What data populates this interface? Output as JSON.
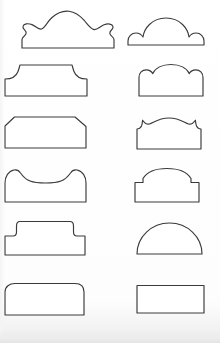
{
  "plate": {
    "title": "Gravestone Profile Shapes Plate",
    "description": "Twelve outline profile shapes arranged in a six-row by two-column grid",
    "width": 220,
    "height": 343,
    "background_color": "#fefefe",
    "outline_color": "#3a3a3a",
    "fill_color": "#ffffff",
    "stroke_width": 1.15,
    "columns": 2,
    "rows": 6,
    "total_shapes": 12
  },
  "shapes": [
    {
      "id": "shape-1",
      "row": 1,
      "column": 1,
      "name": "triple-scallop-crest",
      "label": "Triple scallop crest with lobed shoulders",
      "box": {
        "x": 18,
        "y": 6,
        "width": 88,
        "height": 44
      },
      "path": "M 4 42 L 4 33.5 C 4 30.5 8 30 8.2 27 C 8.4 24 4.4 23.5 5 20.5 C 5.6 17.6 10 17 14 18.6 C 18 20.2 20.5 23.8 23.5 23 C 27 22 29 16 34 11.5 C 39 7 45 4.5 51 5.2 C 57 5.9 62 9.6 66 14.2 C 70 18.8 72.5 23.2 76 23.6 C 79.5 24 82 20.4 86 18.8 C 90 17.2 94.4 17.8 95 20.7 C 95.6 23.7 91.6 24.2 91.8 27.2 C 92 30.2 96 30.7 96 33.7 L 96 42 Z"
    },
    {
      "id": "shape-2",
      "row": 1,
      "column": 2,
      "name": "cloud-dome-crest",
      "label": "Central dome with two rounded shoulder lobes",
      "box": {
        "x": 126,
        "y": 12,
        "width": 80,
        "height": 35
      },
      "path": "M 2 33 L 2 29 C 2 24.5 5.5 21 10 21 C 13 21 15.5 22.6 17 25 C 18 17 25.5 6 40 6 C 54.5 6 62 17 63 25 C 64.5 22.6 67 21 70 21 C 74.5 21 78 24.5 78 29 L 78 33 Z"
    },
    {
      "id": "shape-3",
      "row": 2,
      "column": 1,
      "name": "flared-shoulder-tablet",
      "label": "Flat top tablet with concave flared shoulders",
      "box": {
        "x": 4,
        "y": 62,
        "width": 86,
        "height": 36
      },
      "path": "M 1 34 L 1 17 C 8 17 12 15 14 9.5 C 15.2 6.2 15.6 4 16 3 L 68 3 C 68.4 4 68.8 6.2 70 9.5 C 72 15 76 17 83 17 L 83 34 Z"
    },
    {
      "id": "shape-4",
      "row": 2,
      "column": 2,
      "name": "triple-lobe-arch",
      "label": "Broad central arch flanked by two shoulder lobes",
      "box": {
        "x": 138,
        "y": 62,
        "width": 76,
        "height": 36
      },
      "path": "M 1 34 L 1 15.5 C 1 11 4.2 7.8 8.2 7.8 C 11.2 7.8 13.6 9.4 14.8 11.6 C 17.2 6.2 24 2.5 33 2.5 C 42 2.5 48.8 6.2 51.2 11.6 C 52.4 9.4 54.8 7.8 57.8 7.8 C 61.8 7.8 65 11 65 15.5 L 65 34 Z"
    },
    {
      "id": "shape-5",
      "row": 3,
      "column": 1,
      "name": "chamfered-corner-tablet",
      "label": "Flat top tablet with chamfered upper corners",
      "box": {
        "x": 4,
        "y": 115,
        "width": 86,
        "height": 36
      },
      "path": "M 1 33 L 1 11 L 10.5 2 L 71 2 L 82 11.5 L 82 33 Z"
    },
    {
      "id": "shape-6",
      "row": 3,
      "column": 2,
      "name": "ogee-arch-notched-shoulders",
      "label": "Low segmental arch with notched ogee shoulders",
      "box": {
        "x": 136,
        "y": 115,
        "width": 80,
        "height": 36
      },
      "path": "M 1 34 L 1 14 C 2.5 14 4.5 13 5.5 11 C 6.2 9.5 6.4 7 6.6 5.2 C 8.2 7.6 11 9.5 13.5 9 C 17 8.3 22 3 33 3 C 44 3 49 8.3 52.5 9 C 55 9.5 57.8 7.6 59.4 5.2 C 59.6 7 59.8 9.5 60.5 11 C 61.5 13 63.5 14 65 14 L 65 34 Z"
    },
    {
      "id": "shape-7",
      "row": 4,
      "column": 1,
      "name": "concave-dipped-top",
      "label": "Shouldered tablet with concave dipped top",
      "box": {
        "x": 4,
        "y": 167,
        "width": 86,
        "height": 38
      },
      "path": "M 1 35 L 1 16 C 1 9.5 4.5 4 10 3 C 13 2.5 15 3.6 16.5 6 C 22 14 28 16 41.5 16 C 55 16 61 14 66.5 6 C 68 3.6 70 2.5 73 3 C 78.5 4 82 9.5 82 16 L 82 35 Z"
    },
    {
      "id": "shape-8",
      "row": 4,
      "column": 2,
      "name": "stepped-round-arch",
      "label": "Round arch rising from small stepped shoulders",
      "box": {
        "x": 134,
        "y": 167,
        "width": 80,
        "height": 38
      },
      "path": "M 1 35 L 1 15.5 L 9 15.5 L 9 11.5 C 13 5 22 1.5 33 1.5 C 44 1.5 53 5 57 11.5 L 57 15.5 L 65 15.5 L 65 35 Z"
    },
    {
      "id": "shape-9",
      "row": 5,
      "column": 1,
      "name": "stepped-table-top",
      "label": "Stepped table top with raised central panel",
      "box": {
        "x": 4,
        "y": 218,
        "width": 86,
        "height": 40
      },
      "path": "M 1 37 L 1 18 L 9 18 C 11.5 18 12.5 16.5 12.5 14 L 12.5 8 C 12.5 5.5 13.5 3.5 16 3.5 L 66 3.5 C 68.5 3.5 69.5 5.5 69.5 8 L 69.5 14 C 69.5 16.5 70.5 18 73 18 L 81 18 L 81 37 Z"
    },
    {
      "id": "shape-10",
      "row": 5,
      "column": 2,
      "name": "semicircle-dome",
      "label": "Plain semicircular dome on flat base",
      "box": {
        "x": 136,
        "y": 222,
        "width": 78,
        "height": 34
      },
      "path": "M 1 32 A 32.5 31 0 0 1 66 32 Z"
    },
    {
      "id": "shape-11",
      "row": 6,
      "column": 1,
      "name": "round-top-corner-tablet",
      "label": "Rectangular tablet with rounded top corners",
      "box": {
        "x": 4,
        "y": 282,
        "width": 86,
        "height": 36
      },
      "path": "M 1 33 L 1 10 C 1 4.5 5.5 1.5 11 1.5 L 71 1.5 C 76.5 1.5 80 4.5 80 10 L 80 33 Z"
    },
    {
      "id": "shape-12",
      "row": 6,
      "column": 2,
      "name": "plain-rectangle-tablet",
      "label": "Plain rectangular tablet",
      "box": {
        "x": 136,
        "y": 284,
        "width": 78,
        "height": 32
      },
      "path": "M 1 29 L 1 1.5 L 68 1.5 L 68 29 Z"
    }
  ]
}
